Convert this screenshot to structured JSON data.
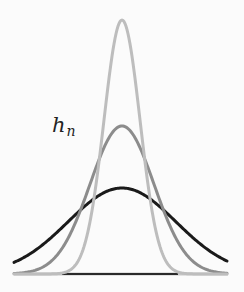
{
  "diagram": {
    "label": {
      "main": "h",
      "subscript": "n"
    },
    "baseline": {
      "y": 274,
      "x_start": 14,
      "x_end": 228,
      "color": "#c8c8c8",
      "dark_segment": [
        62,
        178
      ],
      "dark_color": "#2a2a2a"
    },
    "center_x": 122,
    "curves": [
      {
        "name": "wide",
        "height": 86,
        "sigma": 54,
        "color": "#1a1a1a",
        "width": 3
      },
      {
        "name": "medium",
        "height": 148,
        "sigma": 32,
        "color": "#8c8c8c",
        "width": 3
      },
      {
        "name": "narrow",
        "height": 254,
        "sigma": 18,
        "color": "#bdbdbd",
        "width": 3
      }
    ]
  },
  "chart_data": {
    "type": "line",
    "title": "",
    "xlabel": "",
    "ylabel": "",
    "annotations": [
      "h_n"
    ],
    "series": [
      {
        "name": "h_1 (wide)",
        "shape": "gaussian",
        "relative_peak": 0.34,
        "relative_width": 3.0,
        "color": "black"
      },
      {
        "name": "h_2 (medium)",
        "shape": "gaussian",
        "relative_peak": 0.58,
        "relative_width": 1.78,
        "color": "gray"
      },
      {
        "name": "h_3 (narrow)",
        "shape": "gaussian",
        "relative_peak": 1.0,
        "relative_width": 1.0,
        "color": "light gray"
      }
    ],
    "grid": false,
    "legend": "none"
  }
}
